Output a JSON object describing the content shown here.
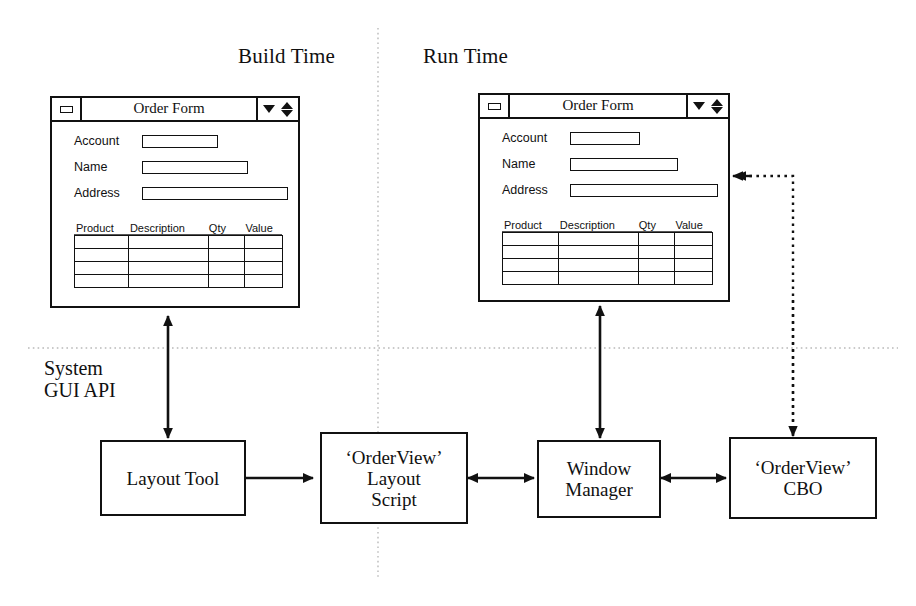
{
  "diagram": {
    "phases": {
      "build": "Build Time",
      "run": "Run Time"
    },
    "api_label": "System\nGUI API",
    "windows": [
      {
        "id": "build-order-form",
        "title": "Order Form",
        "sys_icon": "window-restore-icon",
        "controls": [
          "menu-down-icon",
          "resize-updown-icon"
        ],
        "fields": [
          {
            "label": "Account",
            "value": "",
            "placeholder": ""
          },
          {
            "label": "Name",
            "value": "",
            "placeholder": ""
          },
          {
            "label": "Address",
            "value": "",
            "placeholder": ""
          }
        ],
        "grid": {
          "columns": [
            "Product",
            "Description",
            "Qty",
            "Value"
          ],
          "rows": [
            [
              "",
              "",
              "",
              ""
            ],
            [
              "",
              "",
              "",
              ""
            ],
            [
              "",
              "",
              "",
              ""
            ],
            [
              "",
              "",
              "",
              ""
            ]
          ]
        }
      },
      {
        "id": "run-order-form",
        "title": "Order Form",
        "sys_icon": "window-restore-icon",
        "controls": [
          "menu-down-icon",
          "resize-updown-icon"
        ],
        "fields": [
          {
            "label": "Account",
            "value": "",
            "placeholder": ""
          },
          {
            "label": "Name",
            "value": "",
            "placeholder": ""
          },
          {
            "label": "Address",
            "value": "",
            "placeholder": ""
          }
        ],
        "grid": {
          "columns": [
            "Product",
            "Description",
            "Qty",
            "Value"
          ],
          "rows": [
            [
              "",
              "",
              "",
              ""
            ],
            [
              "",
              "",
              "",
              ""
            ],
            [
              "",
              "",
              "",
              ""
            ],
            [
              "",
              "",
              "",
              ""
            ]
          ]
        }
      }
    ],
    "nodes": [
      {
        "id": "layout-tool",
        "label": "Layout Tool"
      },
      {
        "id": "layout-script",
        "label": "‘OrderView’\nLayout\nScript"
      },
      {
        "id": "window-manager",
        "label": "Window\nManager"
      },
      {
        "id": "order-view-cbo",
        "label": "‘OrderView’\nCBO"
      }
    ],
    "colors": {
      "ink": "#111111",
      "paper": "#ffffff",
      "divider": "#b9b9b9"
    }
  }
}
